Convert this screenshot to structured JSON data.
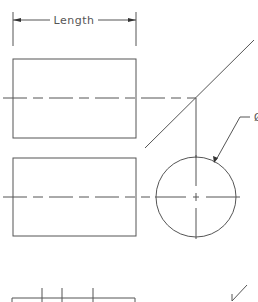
{
  "diagram": {
    "type": "orthographic-projection",
    "dimension": {
      "label": "Length"
    },
    "diameter_callout": {
      "symbol": "Ø"
    },
    "colors": {
      "line": "#555555",
      "background": "#ffffff"
    }
  }
}
